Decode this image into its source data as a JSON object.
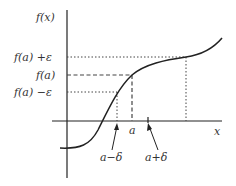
{
  "diagram": {
    "y_axis_label": "f(x)",
    "x_axis_label": "x",
    "y_labels": {
      "upper": "f(a) +ε",
      "middle": "f(a)",
      "lower": "f(a) −ε"
    },
    "x_labels": {
      "a": "a",
      "a_minus_delta": "a−δ",
      "a_plus_delta": "a+δ"
    },
    "colors": {
      "stroke": "#222222",
      "text": "#333333"
    }
  }
}
